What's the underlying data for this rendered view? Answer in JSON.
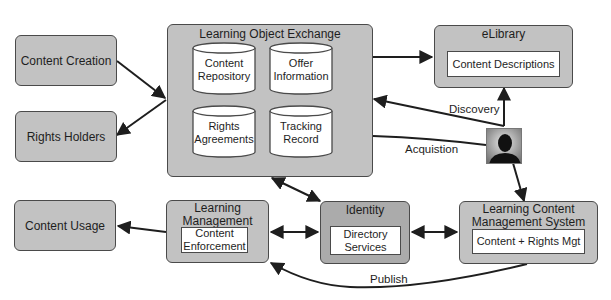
{
  "nodes": {
    "content_creation": {
      "label": "Content Creation"
    },
    "rights_holders": {
      "label": "Rights Holders"
    },
    "content_usage": {
      "label": "Content Usage"
    },
    "learning_object_exchange": {
      "title": "Learning Object Exchange",
      "stores": [
        {
          "line1": "Content",
          "line2": "Repository"
        },
        {
          "line1": "Offer",
          "line2": "Information"
        },
        {
          "line1": "Rights",
          "line2": "Agreements"
        },
        {
          "line1": "Tracking",
          "line2": "Record"
        }
      ]
    },
    "elibrary": {
      "title": "eLibrary",
      "inner": "Content Descriptions"
    },
    "learning_management": {
      "title_line1": "Learning",
      "title_line2": "Management",
      "inner_line1": "Content",
      "inner_line2": "Enforcement"
    },
    "identity": {
      "title": "Identity",
      "inner_line1": "Directory",
      "inner_line2": "Services"
    },
    "lcms": {
      "title_line1": "Learning Content",
      "title_line2": "Management System",
      "inner": "Content + Rights Mgt"
    },
    "user": {
      "icon": "person-silhouette-icon"
    }
  },
  "edge_labels": {
    "discovery": "Discovery",
    "acquisition": "Acquistion",
    "publish": "Publish"
  },
  "colors": {
    "box_fill": "#c2c2c2",
    "box_border": "#4a4a4a",
    "inner_fill": "#ffffff",
    "arrow": "#1e1e1e"
  }
}
